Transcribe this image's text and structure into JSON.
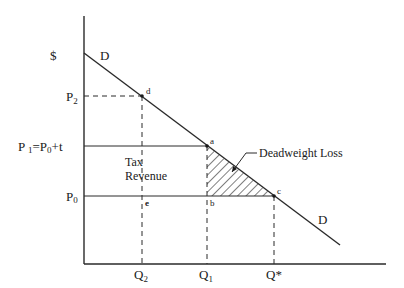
{
  "diagram": {
    "y_axis_label": "$",
    "demand_label_top": "D",
    "demand_label_bottom": "D",
    "price_labels": {
      "p2": "P",
      "p2_sub": "2",
      "p1": "P ",
      "p1_sub": "1",
      "p1_rest": "=P",
      "p1_rest_sub": "0",
      "p1_tail": "+t",
      "p0": "P",
      "p0_sub": "0"
    },
    "quantity_labels": {
      "q2": "Q",
      "q2_sub": "2",
      "q1": "Q",
      "q1_sub": "1",
      "qstar": "Q*"
    },
    "points": {
      "a": "a",
      "b": "b",
      "c": "c",
      "d": "d",
      "e": "e"
    },
    "tax_revenue_line1": "Tax",
    "tax_revenue_line2": "Revenue",
    "deadweight_loss_label": "Deadweight Loss"
  }
}
